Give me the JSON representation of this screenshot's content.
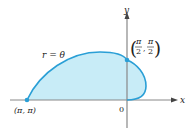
{
  "figure": {
    "curve_label": "r = θ",
    "x_axis_label": "x",
    "y_axis_label": "y",
    "origin_label": "0",
    "points": [
      {
        "label": "(π, π)",
        "x_text": "π",
        "y_text": "π"
      },
      {
        "label": "(π/2, π/2)",
        "x_num": "π",
        "x_den": "2",
        "y_num": "π",
        "y_den": "2"
      }
    ],
    "colors": {
      "curve": "#2a9fd6",
      "fill": "#c8ecf7",
      "axis": "#888888",
      "point": "#2a9fd6"
    }
  }
}
